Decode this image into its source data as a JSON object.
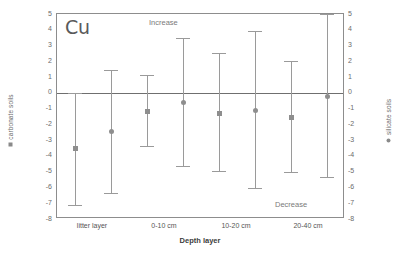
{
  "chart_data": {
    "type": "scatter",
    "title": "Cu",
    "xlabel": "Depth layer",
    "ylabel_left": "carbonate soils",
    "ylabel_right": "silicate soils",
    "ylim": [
      -8,
      5
    ],
    "yticks": [
      "5",
      "4",
      "3",
      "2",
      "1",
      "0",
      "-1",
      "-2",
      "-3",
      "-4",
      "-5",
      "-6",
      "-7",
      "-8"
    ],
    "ytick_values": [
      5,
      4,
      3,
      2,
      1,
      0,
      -1,
      -2,
      -3,
      -4,
      -5,
      -6,
      -7,
      -8
    ],
    "grid": false,
    "legend_position": "axis-labels",
    "categories": [
      "litter layer",
      "0-10 cm",
      "10-20 cm",
      "20-40 cm"
    ],
    "annotations": [
      {
        "text": "Increase",
        "position": "top-center"
      },
      {
        "text": "Decrease",
        "position": "bottom-right"
      }
    ],
    "zero_line": 0,
    "series": [
      {
        "name": "carbonate soils",
        "marker": "square",
        "values": [
          -3.5,
          -1.2,
          -1.3,
          -1.55
        ],
        "err_low": [
          -7.2,
          -3.45,
          -5.05,
          -5.1
        ],
        "err_high": [
          0.0,
          1.15,
          2.5,
          2.05
        ]
      },
      {
        "name": "silicate soils",
        "marker": "circle",
        "values": [
          -2.45,
          -0.6,
          -1.1,
          -0.2
        ],
        "err_low": [
          -6.4,
          -4.7,
          -6.1,
          -5.4
        ],
        "err_high": [
          1.45,
          3.45,
          3.9,
          5.0
        ]
      }
    ],
    "colors": {
      "marker": "#8e8e8e",
      "whisker": "#9a9a9a",
      "axis": "#8d8d8d",
      "zero_line": "#6f6f6f",
      "text": "#5a5a5a"
    }
  }
}
